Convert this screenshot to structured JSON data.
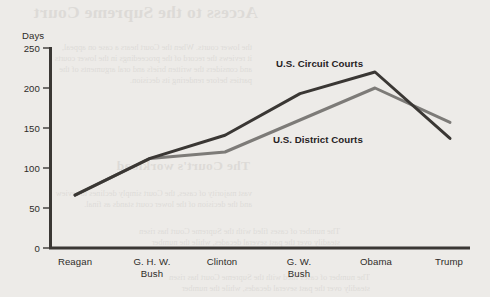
{
  "chart_data": {
    "type": "line",
    "title": "",
    "xlabel": "",
    "ylabel": "Days",
    "ylim": [
      0,
      250
    ],
    "yticks": [
      0,
      50,
      100,
      150,
      200,
      250
    ],
    "grid": false,
    "legend_position": "inline-annotations",
    "categories": [
      "Reagan",
      "G. H. W. Bush",
      "Clinton",
      "G. W. Bush",
      "Obama",
      "Trump"
    ],
    "category_lines": [
      [
        "Reagan"
      ],
      [
        "G. H. W.",
        "Bush"
      ],
      [
        "Clinton"
      ],
      [
        "G. W.",
        "Bush"
      ],
      [
        "Obama"
      ],
      [
        "Trump"
      ]
    ],
    "series": [
      {
        "name": "U.S. Circuit Courts",
        "color": "#3a3734",
        "values": [
          66,
          112,
          141,
          193,
          220,
          137
        ]
      },
      {
        "name": "U.S. District Courts",
        "color": "#7d7b78",
        "values": [
          66,
          112,
          120,
          160,
          200,
          157
        ]
      }
    ],
    "annotations": [
      {
        "text": "U.S. Circuit Courts",
        "x": 276,
        "y": 58
      },
      {
        "text": "U.S. District Courts",
        "x": 273,
        "y": 134
      }
    ]
  },
  "axis": {
    "y_label": "Days",
    "y_ticks": [
      "250",
      "200",
      "150",
      "100",
      "50",
      "0"
    ]
  },
  "background_showthrough": {
    "heading_1": "Access to the Supreme Court",
    "heading_2": "The Court's workload",
    "paragraph_lines_1": [
      "the lower courts. When the Court hears a case on appeal,",
      "it reviews the record of the proceedings in the lower courts",
      "and considers the written briefs and oral arguments of the",
      "parties before rendering its decision."
    ],
    "paragraph_lines_2": [
      "vast majority of cases, the Court simply declines to review",
      "and the decision of the lower court stands as final."
    ],
    "paragraph_lines_3": [
      "The number of cases filed with the Supreme Court has risen",
      "steadily over the past several decades, while the number"
    ]
  }
}
